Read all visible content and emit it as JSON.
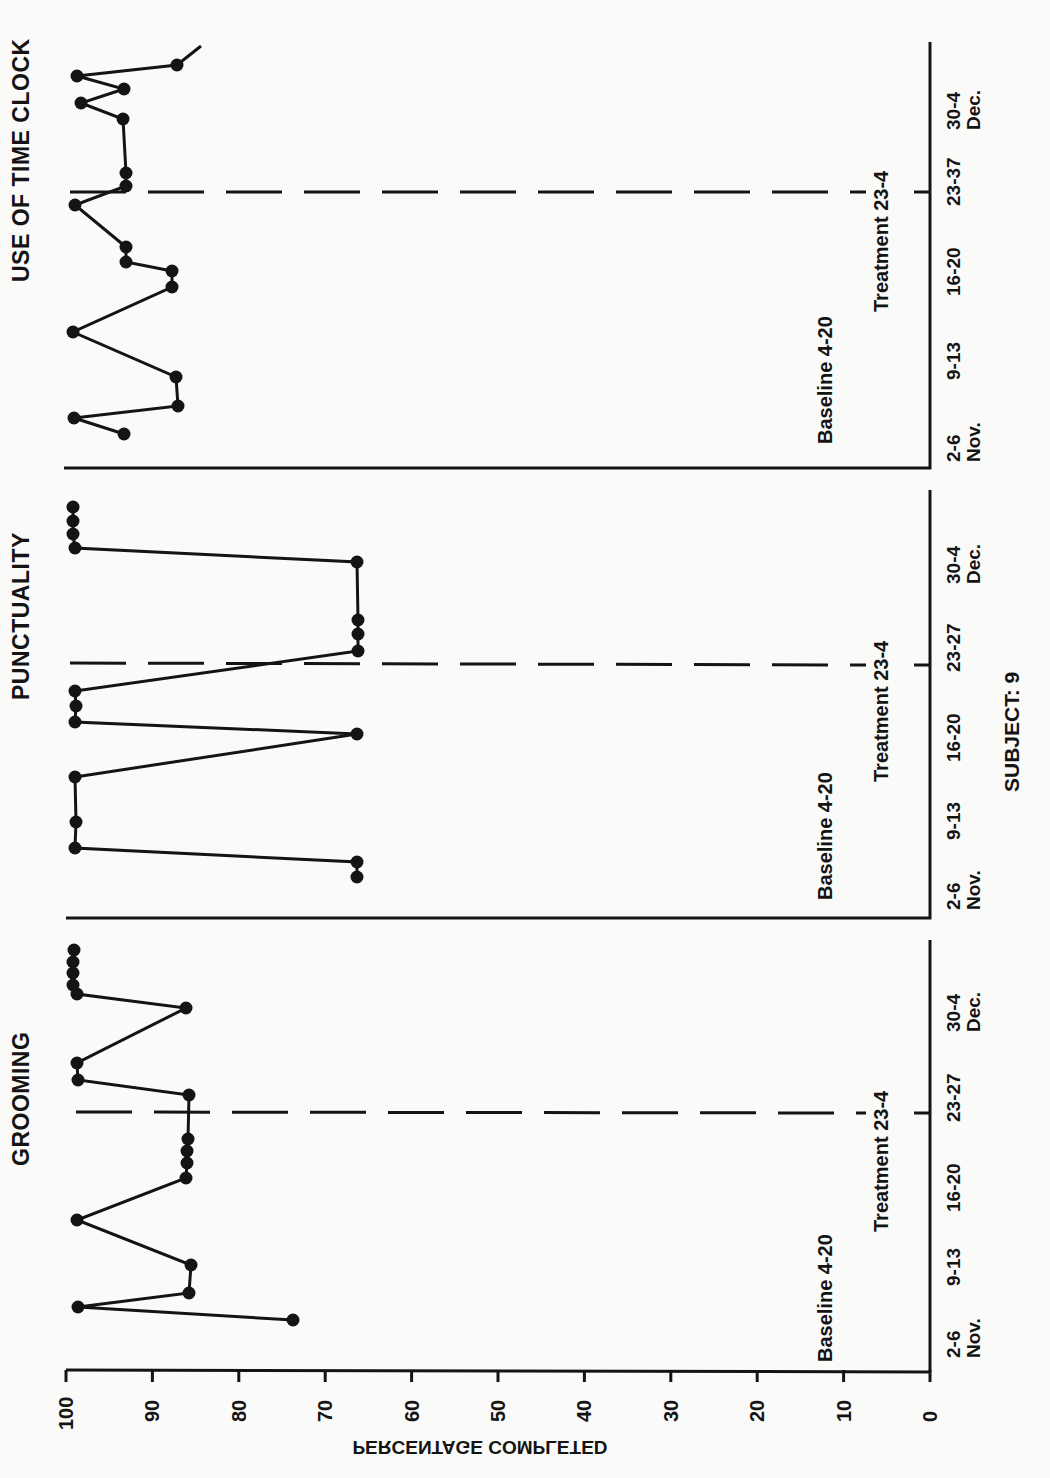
{
  "figure": {
    "subject_label": "SUBJECT: 9",
    "y_axis_title": "PERCENTAGE COMPLETED",
    "y_ticks": [
      100,
      90,
      80,
      70,
      60,
      50,
      40,
      30,
      20,
      10,
      0
    ],
    "orientation": "rotated 90deg counter-clockwise"
  },
  "panels": [
    {
      "title": "USE OF TIME CLOCK",
      "baseline_label": "Baseline 4-20",
      "treatment_label": "Treatment 23-4",
      "date_labels": [
        "2-6\nNov.",
        "9-13",
        "16-20",
        "23-37",
        "30-4\nDec."
      ]
    },
    {
      "title": "PUNCTUALITY",
      "baseline_label": "Baseline 4-20",
      "treatment_label": "Treatment 23-4",
      "date_labels": [
        "2-6\nNov.",
        "9-13",
        "16-20",
        "23-27",
        "30-4\nDec."
      ]
    },
    {
      "title": "GROOMING",
      "baseline_label": "Baseline 4-20",
      "treatment_label": "Treatment 23-4",
      "date_labels": [
        "2-6\nNov.",
        "9-13",
        "16-20",
        "23-27",
        "30-4\nDec."
      ]
    }
  ],
  "chart_data": [
    {
      "type": "line",
      "title": "USE OF TIME CLOCK",
      "xlabel": "",
      "ylabel": "PERCENTAGE COMPLETED",
      "ylim": [
        0,
        100
      ],
      "categories": [
        "2-6 Nov.",
        "9-13",
        "16-20",
        "23-37",
        "30-4 Dec."
      ],
      "phases": [
        {
          "name": "Baseline 4-20",
          "sessions": [
            1,
            9
          ]
        },
        {
          "name": "Treatment 23-4",
          "sessions": [
            10,
            17
          ]
        }
      ],
      "phase_change_after_session": 9,
      "series": [
        {
          "name": "Use of time clock",
          "values": [
            93.5,
            99,
            87.5,
            87.5,
            99,
            88,
            88,
            93.5,
            93.5,
            99,
            93.5,
            93.5,
            93.5,
            98.5,
            94,
            99,
            87.5
          ]
        }
      ],
      "grid": false,
      "legend": "none"
    },
    {
      "type": "line",
      "title": "PUNCTUALITY",
      "xlabel": "",
      "ylabel": "PERCENTAGE COMPLETED",
      "ylim": [
        0,
        100
      ],
      "categories": [
        "2-6 Nov.",
        "9-13",
        "16-20",
        "23-27",
        "30-4 Dec."
      ],
      "phases": [
        {
          "name": "Baseline 4-20",
          "sessions": [
            1,
            9
          ]
        },
        {
          "name": "Treatment 23-4",
          "sessions": [
            10,
            18
          ]
        }
      ],
      "phase_change_after_session": 9,
      "series": [
        {
          "name": "Punctuality",
          "values": [
            66,
            66,
            99,
            99,
            99,
            66,
            99,
            99,
            99,
            66,
            66,
            66,
            66,
            99,
            99,
            99,
            99
          ]
        }
      ],
      "grid": false,
      "legend": "none"
    },
    {
      "type": "line",
      "title": "GROOMING",
      "xlabel": "",
      "ylabel": "PERCENTAGE COMPLETED",
      "ylim": [
        0,
        100
      ],
      "categories": [
        "2-6 Nov.",
        "9-13",
        "16-20",
        "23-27",
        "30-4 Dec."
      ],
      "phases": [
        {
          "name": "Baseline 4-20",
          "sessions": [
            1,
            9
          ]
        },
        {
          "name": "Treatment 23-4",
          "sessions": [
            10,
            18
          ]
        }
      ],
      "phase_change_after_session": 9,
      "series": [
        {
          "name": "Grooming",
          "values": [
            74,
            99,
            86,
            86,
            99,
            86.5,
            86,
            86,
            86,
            86,
            99,
            99,
            86.5,
            99,
            99,
            99,
            99,
            99
          ]
        }
      ],
      "grid": false,
      "legend": "none"
    }
  ],
  "plot_points": {
    "time_clock": [
      [
        201,
        46
      ],
      [
        177,
        65
      ],
      [
        77,
        76
      ],
      [
        124,
        89
      ],
      [
        81,
        103
      ],
      [
        123,
        119
      ],
      [
        126,
        173
      ],
      [
        126,
        186
      ],
      [
        75,
        205
      ],
      [
        126,
        247
      ],
      [
        126,
        262
      ],
      [
        172,
        271
      ],
      [
        172,
        287
      ],
      [
        73,
        332
      ],
      [
        176,
        377
      ],
      [
        178,
        406
      ],
      [
        74,
        418
      ],
      [
        124,
        434
      ]
    ],
    "punctuality": [
      [
        73,
        507
      ],
      [
        73,
        521
      ],
      [
        73,
        534
      ],
      [
        75,
        548
      ],
      [
        357,
        562
      ],
      [
        358,
        620
      ],
      [
        358,
        634
      ],
      [
        358,
        651
      ],
      [
        75,
        691
      ],
      [
        76,
        706
      ],
      [
        75,
        722
      ],
      [
        357,
        734
      ],
      [
        75,
        777
      ],
      [
        76,
        822
      ],
      [
        75,
        848
      ],
      [
        357,
        862
      ],
      [
        357,
        877
      ]
    ],
    "grooming": [
      [
        74,
        950
      ],
      [
        73,
        962
      ],
      [
        73,
        973
      ],
      [
        73,
        985
      ],
      [
        77,
        994
      ],
      [
        186,
        1008
      ],
      [
        77,
        1063
      ],
      [
        78,
        1080
      ],
      [
        189,
        1095
      ],
      [
        188,
        1139
      ],
      [
        187,
        1151
      ],
      [
        187,
        1163
      ],
      [
        186,
        1178
      ],
      [
        77,
        1220
      ],
      [
        191,
        1265
      ],
      [
        189,
        1293
      ],
      [
        78,
        1307
      ],
      [
        293,
        1320
      ]
    ]
  }
}
